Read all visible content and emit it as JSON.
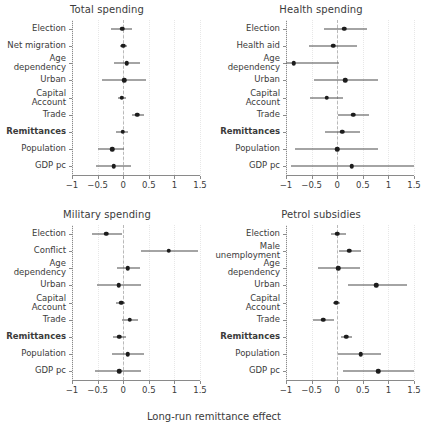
{
  "figure": {
    "xaxis_title": "Long-run remittance effect",
    "tick_labels": [
      "−1",
      "−0.5",
      "0",
      "0.5",
      "1",
      "1.5"
    ],
    "tick_values": [
      -1,
      -0.5,
      0,
      0.5,
      1,
      1.5
    ],
    "colors": {
      "point": "#1c1c1c",
      "interval": "#4a4a4a",
      "axis": "#8a8a8a",
      "zero_reference": "#b9b9b9",
      "background": "#ffffff",
      "text": "#3b3b3b"
    }
  },
  "chart_data": {
    "type": "scatter",
    "title": "",
    "xlabel": "Long-run remittance effect",
    "ylabel": "",
    "xlim": [
      -1,
      1.5
    ],
    "grid": false,
    "legend": null,
    "annotations": [
      "dashed vertical reference line at x = 0"
    ],
    "panels": [
      {
        "title": "Total spending",
        "categories": [
          "Election",
          "Net migration",
          "Age\ndependency",
          "Capital\nAccount",
          "Urban",
          "Trade",
          "Remittances",
          "Population",
          "GDP pc"
        ],
        "rows": [
          {
            "label": "Election",
            "bold": false,
            "estimate": -0.02,
            "ci_low": -0.24,
            "ci_high": 0.17
          },
          {
            "label": "Net migration",
            "bold": false,
            "estimate": 0.0,
            "ci_low": -0.07,
            "ci_high": 0.08
          },
          {
            "label": "Age\ndependency",
            "bold": false,
            "estimate": 0.07,
            "ci_low": -0.17,
            "ci_high": 0.32
          },
          {
            "label": "Urban",
            "bold": false,
            "estimate": 0.02,
            "ci_low": -0.42,
            "ci_high": 0.45
          },
          {
            "label": "Capital\nAccount",
            "bold": false,
            "estimate": -0.03,
            "ci_low": -0.1,
            "ci_high": 0.05
          },
          {
            "label": "Trade",
            "bold": false,
            "estimate": 0.27,
            "ci_low": 0.17,
            "ci_high": 0.4
          },
          {
            "label": "Remittances",
            "bold": true,
            "estimate": -0.01,
            "ci_low": -0.14,
            "ci_high": 0.1
          },
          {
            "label": "Population",
            "bold": false,
            "estimate": -0.21,
            "ci_low": -0.5,
            "ci_high": 0.02
          },
          {
            "label": "GDP pc",
            "bold": false,
            "estimate": -0.18,
            "ci_low": -0.53,
            "ci_high": 0.15
          }
        ]
      },
      {
        "title": "Health spending",
        "categories": [
          "Election",
          "Health aid",
          "Age\ndependency",
          "Urban",
          "Capital\nAccount",
          "Trade",
          "Remittances",
          "Population",
          "GDP pc"
        ],
        "rows": [
          {
            "label": "Election",
            "bold": false,
            "estimate": 0.14,
            "ci_low": -0.25,
            "ci_high": 0.58
          },
          {
            "label": "Health aid",
            "bold": false,
            "estimate": -0.08,
            "ci_low": -0.55,
            "ci_high": 0.38
          },
          {
            "label": "Age\ndependency",
            "bold": false,
            "estimate": -0.85,
            "ci_low": -1.65,
            "ci_high": 0.03
          },
          {
            "label": "Urban",
            "bold": false,
            "estimate": 0.16,
            "ci_low": -0.46,
            "ci_high": 0.8
          },
          {
            "label": "Capital\nAccount",
            "bold": false,
            "estimate": -0.2,
            "ci_low": -0.54,
            "ci_high": 0.12
          },
          {
            "label": "Trade",
            "bold": false,
            "estimate": 0.31,
            "ci_low": 0.01,
            "ci_high": 0.62
          },
          {
            "label": "Remittances",
            "bold": true,
            "estimate": 0.1,
            "ci_low": -0.23,
            "ci_high": 0.45
          },
          {
            "label": "Population",
            "bold": false,
            "estimate": 0.0,
            "ci_low": -0.82,
            "ci_high": 0.8
          },
          {
            "label": "GDP pc",
            "bold": false,
            "estimate": 0.28,
            "ci_low": -0.9,
            "ci_high": 1.5
          }
        ]
      },
      {
        "title": "Military spending",
        "categories": [
          "Election",
          "Conflict",
          "Age\ndependency",
          "Urban",
          "Capital\nAccount",
          "Trade",
          "Remittances",
          "Population",
          "GDP pc"
        ],
        "rows": [
          {
            "label": "Election",
            "bold": false,
            "estimate": -0.33,
            "ci_low": -0.6,
            "ci_high": -0.02
          },
          {
            "label": "Conflict",
            "bold": false,
            "estimate": 0.89,
            "ci_low": 0.34,
            "ci_high": 1.46
          },
          {
            "label": "Age\ndependency",
            "bold": false,
            "estimate": 0.09,
            "ci_low": -0.13,
            "ci_high": 0.32
          },
          {
            "label": "Urban",
            "bold": false,
            "estimate": -0.09,
            "ci_low": -0.52,
            "ci_high": 0.34
          },
          {
            "label": "Capital\nAccount",
            "bold": false,
            "estimate": -0.04,
            "ci_low": -0.14,
            "ci_high": 0.04
          },
          {
            "label": "Trade",
            "bold": false,
            "estimate": 0.13,
            "ci_low": -0.02,
            "ci_high": 0.29
          },
          {
            "label": "Remittances",
            "bold": true,
            "estimate": -0.08,
            "ci_low": -0.2,
            "ci_high": 0.06
          },
          {
            "label": "Population",
            "bold": false,
            "estimate": 0.09,
            "ci_low": -0.22,
            "ci_high": 0.4
          },
          {
            "label": "GDP pc",
            "bold": false,
            "estimate": -0.08,
            "ci_low": -0.56,
            "ci_high": 0.35
          }
        ]
      },
      {
        "title": "Petrol subsidies",
        "categories": [
          "Election",
          "Male\nunemployment",
          "Age\ndependency",
          "Urban",
          "Capital\nAccount",
          "Trade",
          "Remittances",
          "Population",
          "GDP pc"
        ],
        "rows": [
          {
            "label": "Election",
            "bold": false,
            "estimate": 0.0,
            "ci_low": -0.12,
            "ci_high": 0.18
          },
          {
            "label": "Male\nunemployment",
            "bold": false,
            "estimate": 0.24,
            "ci_low": 0.04,
            "ci_high": 0.46
          },
          {
            "label": "Age\ndependency",
            "bold": false,
            "estimate": 0.02,
            "ci_low": -0.38,
            "ci_high": 0.44
          },
          {
            "label": "Urban",
            "bold": false,
            "estimate": 0.76,
            "ci_low": 0.21,
            "ci_high": 1.36
          },
          {
            "label": "Capital\nAccount",
            "bold": false,
            "estimate": -0.02,
            "ci_low": -0.09,
            "ci_high": 0.05
          },
          {
            "label": "Trade",
            "bold": false,
            "estimate": -0.27,
            "ci_low": -0.47,
            "ci_high": -0.06
          },
          {
            "label": "Remittances",
            "bold": true,
            "estimate": 0.18,
            "ci_low": 0.07,
            "ci_high": 0.29
          },
          {
            "label": "Population",
            "bold": false,
            "estimate": 0.46,
            "ci_low": 0.02,
            "ci_high": 0.86
          },
          {
            "label": "GDP pc",
            "bold": false,
            "estimate": 0.8,
            "ci_low": 0.12,
            "ci_high": 1.5
          }
        ]
      }
    ]
  }
}
